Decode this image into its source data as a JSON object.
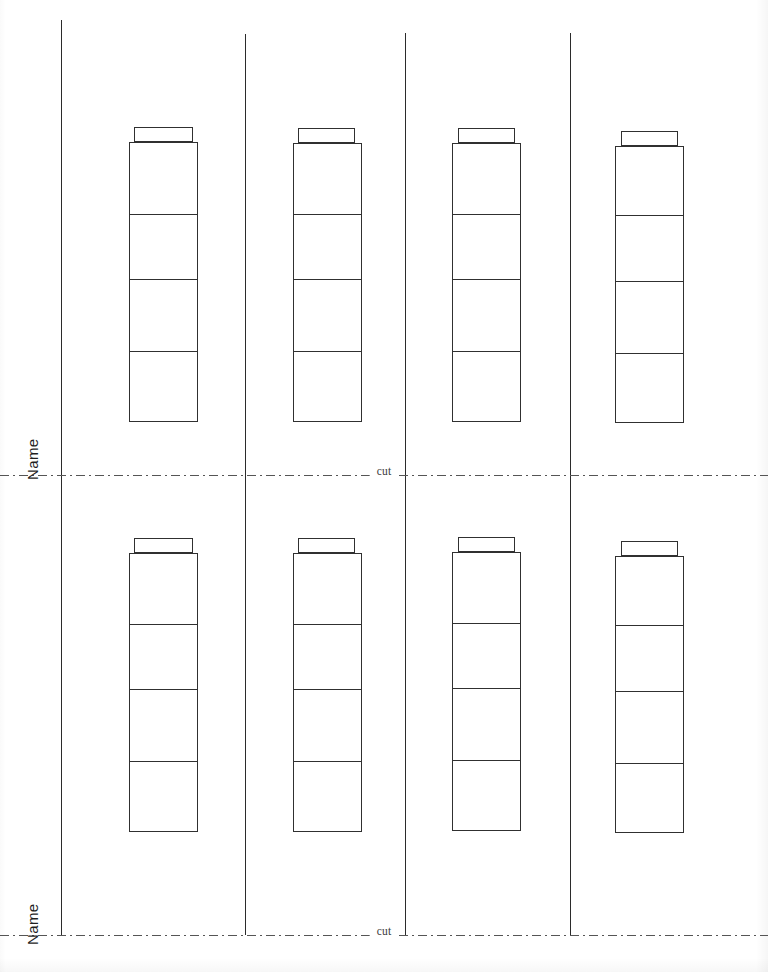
{
  "document": {
    "title": "Cut-out Tower Worksheet",
    "page_width": 768,
    "page_height": 972,
    "background_color": "#ffffff",
    "ink_color": "#303030"
  },
  "labels": {
    "name": "Name",
    "cut": "cut"
  },
  "name_fields": [
    {
      "label": "Name",
      "x": 40,
      "y": 465,
      "font_size": 15
    },
    {
      "label": "Name",
      "x": 40,
      "y": 930,
      "font_size": 15
    }
  ],
  "cut_lines": [
    {
      "label": "cut",
      "y": 475,
      "style": "dash-dot",
      "color": "#555555"
    },
    {
      "label": "cut",
      "y": 935,
      "style": "dash-dot",
      "color": "#555555"
    }
  ],
  "vertical_rules": [
    {
      "x": 61,
      "top": 20,
      "bottom": 935,
      "color": "#2b2b2b"
    },
    {
      "x": 245,
      "top": 34,
      "bottom": 935,
      "color": "#2b2b2b"
    },
    {
      "x": 405,
      "top": 33,
      "bottom": 935,
      "color": "#2b2b2b"
    },
    {
      "x": 570,
      "top": 33,
      "bottom": 935,
      "color": "#2b2b2b"
    }
  ],
  "towers": [
    {
      "id": "tower-r1-c1",
      "row": 1,
      "column": 1,
      "cap": {
        "x": 134,
        "y": 127,
        "width": 59,
        "height": 15
      },
      "body": {
        "x": 129,
        "y": 142,
        "width": 69,
        "height": 280
      },
      "segments": 4,
      "divider_offsets": [
        73,
        138,
        210
      ]
    },
    {
      "id": "tower-r1-c2",
      "row": 1,
      "column": 2,
      "cap": {
        "x": 298,
        "y": 128,
        "width": 57,
        "height": 15
      },
      "body": {
        "x": 293,
        "y": 143,
        "width": 69,
        "height": 279
      },
      "segments": 4,
      "divider_offsets": [
        72,
        137,
        209
      ]
    },
    {
      "id": "tower-r1-c3",
      "row": 1,
      "column": 3,
      "cap": {
        "x": 458,
        "y": 128,
        "width": 57,
        "height": 15
      },
      "body": {
        "x": 452,
        "y": 143,
        "width": 69,
        "height": 279
      },
      "segments": 4,
      "divider_offsets": [
        72,
        137,
        209
      ]
    },
    {
      "id": "tower-r1-c4",
      "row": 1,
      "column": 4,
      "cap": {
        "x": 621,
        "y": 131,
        "width": 57,
        "height": 15
      },
      "body": {
        "x": 615,
        "y": 146,
        "width": 69,
        "height": 277
      },
      "segments": 4,
      "divider_offsets": [
        70,
        136,
        208
      ]
    },
    {
      "id": "tower-r2-c1",
      "row": 2,
      "column": 1,
      "cap": {
        "x": 134,
        "y": 538,
        "width": 59,
        "height": 15
      },
      "body": {
        "x": 129,
        "y": 553,
        "width": 69,
        "height": 279
      },
      "segments": 4,
      "divider_offsets": [
        72,
        137,
        209
      ]
    },
    {
      "id": "tower-r2-c2",
      "row": 2,
      "column": 2,
      "cap": {
        "x": 298,
        "y": 538,
        "width": 57,
        "height": 15
      },
      "body": {
        "x": 293,
        "y": 553,
        "width": 69,
        "height": 279
      },
      "segments": 4,
      "divider_offsets": [
        72,
        137,
        209
      ]
    },
    {
      "id": "tower-r2-c3",
      "row": 2,
      "column": 3,
      "cap": {
        "x": 458,
        "y": 537,
        "width": 57,
        "height": 15
      },
      "body": {
        "x": 452,
        "y": 552,
        "width": 69,
        "height": 279
      },
      "segments": 4,
      "divider_offsets": [
        72,
        137,
        209
      ]
    },
    {
      "id": "tower-r2-c4",
      "row": 2,
      "column": 4,
      "cap": {
        "x": 621,
        "y": 541,
        "width": 57,
        "height": 15
      },
      "body": {
        "x": 615,
        "y": 556,
        "width": 69,
        "height": 277
      },
      "segments": 4,
      "divider_offsets": [
        70,
        136,
        208
      ]
    }
  ]
}
